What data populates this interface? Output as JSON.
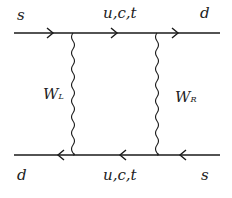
{
  "diagram": {
    "type": "feynman-box-diagram",
    "line_color": "#1a1a1a",
    "top_fermion_line": {
      "direction": "right",
      "left_label": "s",
      "middle_label": "u,c,t",
      "right_label": "d"
    },
    "bottom_fermion_line": {
      "direction": "left",
      "left_label": "d",
      "middle_label": "u,c,t",
      "right_label": "s"
    },
    "left_boson": {
      "label_main": "W",
      "label_sub": "L"
    },
    "right_boson": {
      "label_main": "W",
      "label_sub": "R"
    }
  }
}
